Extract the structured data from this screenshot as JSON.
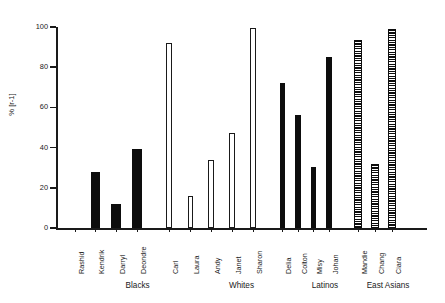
{
  "chart_data": {
    "type": "bar",
    "title": "",
    "xlabel": "",
    "ylabel": "% [r-1]",
    "ylim": [
      0,
      100
    ],
    "yticks": [
      0,
      20,
      40,
      60,
      80,
      100
    ],
    "ytick_labels": [
      "0",
      "20",
      "40",
      "60",
      "80",
      "100"
    ],
    "grid": false,
    "legend": "none",
    "categories": [
      "Rashid",
      "Kendrik",
      "Darryl",
      "Deondre",
      "Carl",
      "Laura",
      "Andy",
      "Janet",
      "Sharon",
      "Delia",
      "Colton",
      "Misy",
      "Johan",
      "Mandie",
      "Chang",
      "Ciara"
    ],
    "values": [
      0,
      28,
      12,
      39.5,
      92,
      16,
      34,
      47.5,
      99.5,
      72,
      56,
      30.5,
      85,
      93.5,
      32,
      99
    ],
    "bars": [
      {
        "label": "Rashid",
        "value": 0,
        "group": "Blacks",
        "style": "solid"
      },
      {
        "label": "Kendrik",
        "value": 28,
        "group": "Blacks",
        "style": "solid"
      },
      {
        "label": "Darryl",
        "value": 12,
        "group": "Blacks",
        "style": "solid"
      },
      {
        "label": "Deondre",
        "value": 39.5,
        "group": "Blacks",
        "style": "solid"
      },
      {
        "label": "Carl",
        "value": 92,
        "group": "Whites",
        "style": "open"
      },
      {
        "label": "Laura",
        "value": 16,
        "group": "Whites",
        "style": "open"
      },
      {
        "label": "Andy",
        "value": 34,
        "group": "Whites",
        "style": "open"
      },
      {
        "label": "Janet",
        "value": 47.5,
        "group": "Whites",
        "style": "open"
      },
      {
        "label": "Sharon",
        "value": 99.5,
        "group": "Whites",
        "style": "open"
      },
      {
        "label": "Delia",
        "value": 72,
        "group": "Latinos",
        "style": "solid"
      },
      {
        "label": "Colton",
        "value": 56,
        "group": "Latinos",
        "style": "solid"
      },
      {
        "label": "Misy",
        "value": 30.5,
        "group": "Latinos",
        "style": "solid"
      },
      {
        "label": "Johan",
        "value": 85,
        "group": "Latinos",
        "style": "solid"
      },
      {
        "label": "Mandie",
        "value": 93.5,
        "group": "East Asians",
        "style": "hatch"
      },
      {
        "label": "Chang",
        "value": 32,
        "group": "East Asians",
        "style": "hatch"
      },
      {
        "label": "Ciara",
        "value": 99,
        "group": "East Asians",
        "style": "hatch"
      }
    ],
    "groups": [
      {
        "name": "Blacks",
        "center_pct": 22.0
      },
      {
        "name": "Whites",
        "center_pct": 50.0
      },
      {
        "name": "Latinos",
        "center_pct": 72.5
      },
      {
        "name": "East Asians",
        "center_pct": 89.5
      }
    ],
    "colors": {
      "axis": "#1a1a1a",
      "bar_solid": "#0d0d0d",
      "bar_open_fill": "#ffffff",
      "bar_open_edge": "#1a1a1a",
      "bar_hatch": "#0d0d0d",
      "background": "#ffffff"
    }
  }
}
